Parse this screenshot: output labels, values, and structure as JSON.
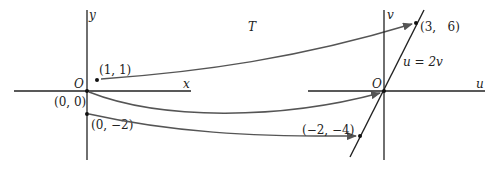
{
  "diagram": {
    "transform_label": "T",
    "left_plane": {
      "x_axis_label": "x",
      "y_axis_label": "y",
      "origin_label": "O",
      "points": [
        {
          "label": "(1, 1)",
          "x": 1,
          "y": 1
        },
        {
          "label": "(0, 0)",
          "x": 0,
          "y": 0
        },
        {
          "label": "(0, −2)",
          "x": 0,
          "y": -2
        }
      ]
    },
    "right_plane": {
      "u_axis_label": "u",
      "v_axis_label": "v",
      "origin_label": "O",
      "line_label": "u = 2v",
      "points": [
        {
          "label": "(3,   6)",
          "u": 3,
          "v": 6
        },
        {
          "label": "O",
          "u": 0,
          "v": 0
        },
        {
          "label": "(−2, −4)",
          "u": -2,
          "v": -4
        }
      ]
    },
    "mappings": [
      {
        "from": "(1, 1)",
        "to": "(3, 6)"
      },
      {
        "from": "(0, 0)",
        "to": "(0, 0)"
      },
      {
        "from": "(0, −2)",
        "to": "(−2, −4)"
      }
    ],
    "colors": {
      "axis": "#222222",
      "arrow": "#555555",
      "background": "#ffffff"
    }
  }
}
